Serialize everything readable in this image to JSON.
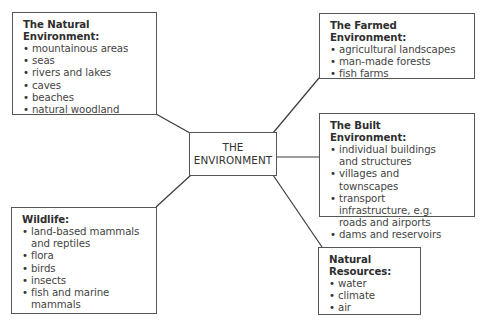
{
  "center": {
    "line1": "THE",
    "line2": "ENVIRONMENT"
  },
  "natural_environment": {
    "title": "The Natural Environment:",
    "items": [
      "mountainous areas",
      "seas",
      "rivers and lakes",
      "caves",
      "beaches",
      "natural woodland"
    ]
  },
  "farmed_environment": {
    "title": "The Farmed Environment:",
    "items": [
      "agricultural landscapes",
      "man-made forests",
      "fish farms"
    ]
  },
  "built_environment": {
    "title": "The Built Environment:",
    "items": [
      "individual buildings and structures",
      "villages and townscapes",
      "transport infrastructure, e.g. roads and airports",
      "dams and reservoirs"
    ]
  },
  "wildlife": {
    "title": "Wildlife:",
    "items": [
      "land-based mammals and reptiles",
      "flora",
      "birds",
      "insects",
      "fish and marine mammals"
    ]
  },
  "natural_resources": {
    "title": "Natural Resources:",
    "items": [
      "water",
      "climate",
      "air"
    ]
  },
  "colors": {
    "line": "#3a3a3a",
    "border": "#555555",
    "text": "#3a3a3a"
  }
}
